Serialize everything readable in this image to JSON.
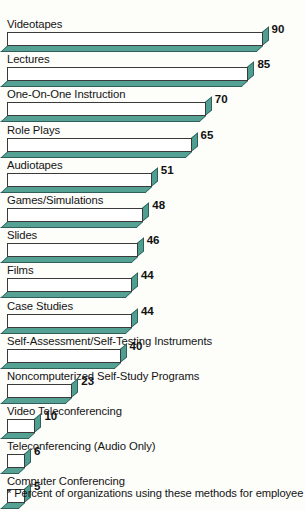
{
  "chart_data": {
    "type": "bar",
    "orientation": "horizontal",
    "title": "",
    "subtitle": "",
    "xlabel": "",
    "ylabel": "",
    "xlim": [
      0,
      100
    ],
    "grid": false,
    "legend": null,
    "value_suffix": "",
    "categories": [
      "Videotapes",
      "Lectures",
      "One-On-One Instruction",
      "Role Plays",
      "Audiotapes",
      "Games/Simulations",
      "Slides",
      "Films",
      "Case Studies",
      "Self-Assessment/Self-Testing Instruments",
      "Noncomputerized Self-Study Programs",
      "Video Teleconferencing",
      "Teleconferencing (Audio Only)",
      "Computer Conferencing"
    ],
    "values": [
      90,
      85,
      70,
      65,
      51,
      48,
      46,
      44,
      44,
      40,
      23,
      10,
      6,
      5
    ],
    "annotations": [
      "* Percent of organizations using these methods for employee"
    ]
  },
  "footnote": {
    "text": "* Percent of organizations using these methods for employee"
  },
  "style": {
    "bar_fill": "#ffffff",
    "bar_outline": "#3a3a3a",
    "bar_shadow": "#55a294",
    "bar_shadow_outline": "#2f5f58",
    "background": "#fdfdfa",
    "text_color": "#141414"
  }
}
